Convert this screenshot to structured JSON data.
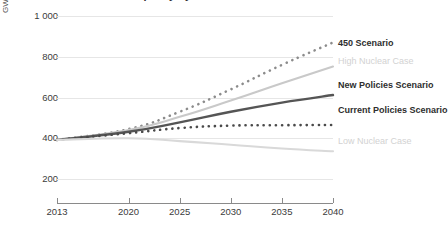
{
  "title": "Global installed nuclear capacity by scenario and case",
  "axis": {
    "y_unit": "GW",
    "y_ticks": [
      "1 000",
      "800",
      "600",
      "400",
      "200"
    ],
    "y_tick_values": [
      1000,
      800,
      600,
      400,
      200
    ],
    "x_ticks": [
      "2013",
      "2020",
      "2025",
      "2030",
      "2035",
      "2040"
    ],
    "x_tick_values": [
      2013,
      2020,
      2025,
      2030,
      2035,
      2040
    ]
  },
  "labels": {
    "s450": "450 Scenario",
    "high_nuclear": "High Nuclear Case",
    "new_policies": "New Policies Scenario",
    "current_policies": "Current Policies Scenario",
    "low_nuclear": "Low Nuclear Case"
  },
  "colors": {
    "s450": "#8c8c8c",
    "high_nuclear": "#c9c9c9",
    "new_policies": "#555555",
    "current_policies": "#4a4a4a",
    "low_nuclear": "#d9d9d9",
    "grid": "#e6e6e6",
    "axis": "#8a8a8a",
    "text": "#3b3b3b"
  },
  "chart_data": {
    "type": "line",
    "title": "Global installed nuclear capacity by scenario and case",
    "xlabel": "",
    "ylabel": "GW",
    "ylim": [
      200,
      1000
    ],
    "xlim": [
      2013,
      2040
    ],
    "grid": true,
    "legend": "right-inline",
    "x": [
      2013,
      2020,
      2025,
      2030,
      2035,
      2040
    ],
    "series": [
      {
        "name": "450 Scenario",
        "style": "dotted",
        "color": "#8c8c8c",
        "values": [
          392,
          445,
          530,
          640,
          760,
          870
        ]
      },
      {
        "name": "High Nuclear Case",
        "style": "solid",
        "color": "#c9c9c9",
        "values": [
          392,
          440,
          505,
          585,
          670,
          752
        ]
      },
      {
        "name": "New Policies Scenario",
        "style": "solid",
        "color": "#555555",
        "values": [
          392,
          432,
          478,
          530,
          575,
          612
        ]
      },
      {
        "name": "Current Policies Scenario",
        "style": "dotted",
        "color": "#4a4a4a",
        "values": [
          392,
          425,
          450,
          462,
          464,
          465
        ]
      },
      {
        "name": "Low Nuclear Case",
        "style": "solid",
        "color": "#d9d9d9",
        "values": [
          392,
          400,
          386,
          368,
          350,
          336
        ]
      }
    ]
  }
}
